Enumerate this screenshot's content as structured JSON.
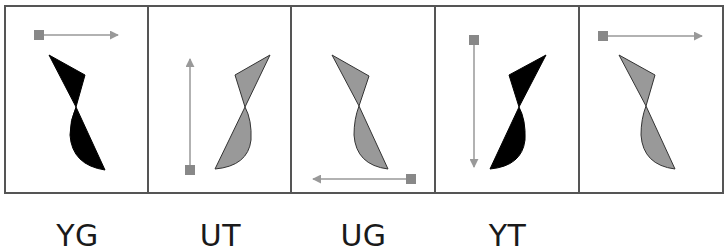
{
  "figure": {
    "frame": {
      "x": 5,
      "y": 6,
      "width": 718,
      "height": 187,
      "stroke": "#555555"
    },
    "dividers_x": [
      148,
      291,
      435,
      579
    ],
    "colors": {
      "black_fill": "#000000",
      "gray_fill": "#999999",
      "outline": "#333333",
      "arrow": "#999999",
      "arrow_square": "#888888"
    },
    "panels": [
      {
        "id": "panel-1",
        "label": "YG",
        "fill": "black",
        "arrow_direction": "right",
        "arrow": {
          "start": [
            39,
            35
          ],
          "end": [
            118,
            35
          ]
        },
        "upper_triangle": [
          [
            49,
            55
          ],
          [
            85,
            75
          ],
          [
            76,
            107
          ]
        ],
        "lower_lobe": {
          "pinch": [
            76,
            107
          ],
          "tip": [
            105,
            170
          ],
          "bulge": "left"
        }
      },
      {
        "id": "panel-2",
        "label": "UT",
        "fill": "gray",
        "arrow_direction": "up",
        "arrow": {
          "start": [
            190,
            170
          ],
          "end": [
            190,
            59
          ]
        },
        "upper_triangle": [
          [
            235,
            75
          ],
          [
            270,
            55
          ],
          [
            245,
            107
          ]
        ],
        "lower_lobe": {
          "pinch": [
            245,
            107
          ],
          "tip": [
            215,
            169
          ],
          "bulge": "right"
        }
      },
      {
        "id": "panel-3",
        "label": "UG",
        "fill": "gray",
        "arrow_direction": "left",
        "arrow": {
          "start": [
            411,
            179
          ],
          "end": [
            313,
            179
          ]
        },
        "upper_triangle": [
          [
            332,
            55
          ],
          [
            369,
            76
          ],
          [
            359,
            106
          ]
        ],
        "lower_lobe": {
          "pinch": [
            359,
            106
          ],
          "tip": [
            388,
            169
          ],
          "bulge": "left"
        }
      },
      {
        "id": "panel-4",
        "label": "YT",
        "fill": "black",
        "arrow_direction": "down",
        "arrow": {
          "start": [
            474,
            40
          ],
          "end": [
            474,
            167
          ]
        },
        "upper_triangle": [
          [
            509,
            75
          ],
          [
            546,
            55
          ],
          [
            519,
            107
          ]
        ],
        "lower_lobe": {
          "pinch": [
            519,
            107
          ],
          "tip": [
            490,
            169
          ],
          "bulge": "right"
        }
      },
      {
        "id": "panel-5",
        "label": "",
        "fill": "gray",
        "arrow_direction": "right",
        "arrow": {
          "start": [
            603,
            36
          ],
          "end": [
            702,
            36
          ]
        },
        "upper_triangle": [
          [
            619,
            55
          ],
          [
            655,
            75
          ],
          [
            646,
            106
          ]
        ],
        "lower_lobe": {
          "pinch": [
            646,
            106
          ],
          "tip": [
            675,
            169
          ],
          "bulge": "left"
        }
      }
    ],
    "labels": [
      {
        "text": "YG",
        "panel": 1
      },
      {
        "text": "UT",
        "panel": 2
      },
      {
        "text": "UG",
        "panel": 3
      },
      {
        "text": "YT",
        "panel": 4
      }
    ]
  }
}
